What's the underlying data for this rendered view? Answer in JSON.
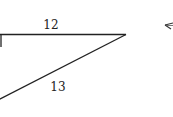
{
  "diagram": {
    "type": "right-triangle",
    "colors": {
      "stroke": "#222222",
      "background": "#ffffff"
    },
    "labels": {
      "top_side": "12",
      "hypotenuse": "13"
    },
    "sides": [
      {
        "name": "top side",
        "length": "12"
      },
      {
        "name": "hypotenuse",
        "length": "13"
      }
    ],
    "right_angle_marker": true,
    "partial_shape_right_edge": "arrow-like triangle fragment"
  }
}
